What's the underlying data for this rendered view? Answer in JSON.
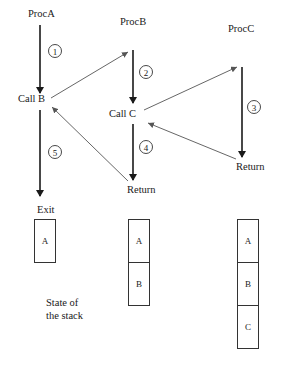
{
  "diagram": {
    "procedures": [
      {
        "name": "ProcA",
        "call_label": "Call B",
        "end_label": "Exit"
      },
      {
        "name": "ProcB",
        "call_label": "Call C",
        "end_label": "Return"
      },
      {
        "name": "ProcC",
        "end_label": "Return"
      }
    ],
    "steps": [
      "1",
      "2",
      "3",
      "4",
      "5"
    ],
    "stacks": [
      {
        "frames": [
          "A"
        ]
      },
      {
        "frames": [
          "A",
          "B"
        ]
      },
      {
        "frames": [
          "A",
          "B",
          "C"
        ]
      }
    ],
    "caption": {
      "line1": "State of",
      "line2": "the stack"
    },
    "colors": {
      "stroke": "#1a1a1a",
      "thin_arrow": "#555555",
      "background": "#ffffff"
    }
  }
}
